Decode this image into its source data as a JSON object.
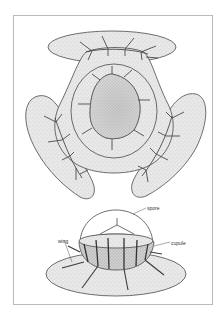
{
  "figure": {
    "top_view": {
      "description": "three-winged seed, top view"
    },
    "side_view": {
      "labels": [
        {
          "id": "spore",
          "text": "spore"
        },
        {
          "id": "cupule",
          "text": "cupule"
        },
        {
          "id": "wing",
          "text": "wing"
        }
      ]
    }
  },
  "colors": {
    "frame": "#b9b9b9",
    "outline": "#4a4a4a",
    "fill": "#e6e6e6",
    "ink": "#3a3a3a"
  }
}
